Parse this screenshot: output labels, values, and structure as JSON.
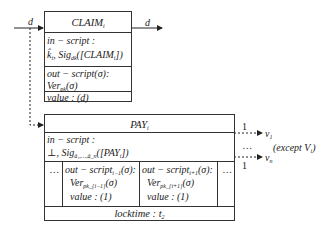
{
  "claim": {
    "title": "CLAIM",
    "title_sub": "i",
    "in_script_label": "in − script :",
    "in_script_value": "k̂",
    "in_script_value_sub": "i",
    "in_script_sig": ", Sig",
    "in_script_sig_sub": "dk",
    "in_script_arg": "([CLAIM",
    "in_script_arg_sub": "i",
    "in_script_arg_end": "])",
    "out_script_label": "out − script(σ):",
    "out_script_ver": "Ver",
    "out_script_ver_sub": "pk",
    "out_script_ver_arg": "(σ)",
    "value": "value : (d)",
    "input_label": "d",
    "output_label": "d"
  },
  "pay": {
    "title": "PAY",
    "title_sub": "i",
    "in_script_label": "in − script :",
    "in_script_value": "⊥, Sig",
    "in_script_sig_sub": "â₁,…,â_n",
    "in_script_arg": "([PAY",
    "in_script_arg_sub": "i",
    "in_script_arg_end": "])",
    "ellipsis_left": "…",
    "ellipsis_right": "…",
    "outputs": [
      {
        "label": "out − script",
        "label_sub": "i−1",
        "label_end": "(σ):",
        "ver": "Ver",
        "ver_sub": "pk_{i−1}",
        "ver_arg": "(σ)",
        "value": "value : (1)"
      },
      {
        "label": "out − script",
        "label_sub": "i+1",
        "label_end": "(σ):",
        "ver": "Ver",
        "ver_sub": "pk_{i+1}",
        "ver_arg": "(σ)",
        "value": "value : (1)"
      }
    ],
    "locktime": "locktime : t",
    "locktime_sub": "2"
  },
  "right_outputs": {
    "v1_amount": "1",
    "v1_label": "v",
    "v1_sub": "1",
    "ellipsis": "…",
    "vn_amount": "1",
    "vn_label": "v",
    "vn_sub": "n",
    "note": "(except V",
    "note_sub": "i",
    "note_end": ")"
  }
}
